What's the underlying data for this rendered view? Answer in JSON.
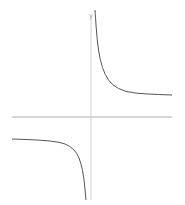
{
  "chart_data": {
    "type": "line",
    "title": "",
    "xlabel": "",
    "ylabel": "y",
    "function": "y = 1/x + c (rectangular hyperbola with horizontal asymptote above x-axis)",
    "grid": false,
    "legend": null,
    "axes": {
      "x_axis_pixel_y": 117,
      "y_axis_pixel_x": 91,
      "x_range_pixels": [
        12,
        172
      ],
      "y_range_pixels": [
        10,
        200
      ]
    },
    "series": [
      {
        "name": "right-branch",
        "description": "descends from top near y-axis, approaches upper horizontal asymptote",
        "points_px": [
          [
            95,
            10
          ],
          [
            97,
            40
          ],
          [
            100,
            60
          ],
          [
            105,
            75
          ],
          [
            112,
            85
          ],
          [
            125,
            92
          ],
          [
            145,
            94
          ],
          [
            172,
            95
          ]
        ]
      },
      {
        "name": "left-branch",
        "description": "starts flat below x-axis, plunges downward near y-axis",
        "points_px": [
          [
            12,
            139
          ],
          [
            40,
            140
          ],
          [
            60,
            142
          ],
          [
            70,
            146
          ],
          [
            77,
            153
          ],
          [
            81,
            163
          ],
          [
            84,
            178
          ],
          [
            86,
            200
          ]
        ]
      }
    ],
    "asymptotes": {
      "vertical": "y-axis",
      "horizontal_upper_px": 95,
      "horizontal_lower_px": 139
    }
  },
  "labels": {
    "y_axis": "y"
  }
}
